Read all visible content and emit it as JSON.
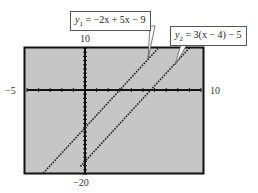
{
  "chart_data": {
    "type": "line",
    "title": "",
    "xlabel": "",
    "ylabel": "",
    "xlim": [
      -5,
      10
    ],
    "ylim": [
      -20,
      10
    ],
    "xtick_step": 1,
    "ytick_step": 1,
    "grid": false,
    "window_labels": {
      "xmin": "−5",
      "xmax": "10",
      "ymin": "−20",
      "ymax": "10"
    },
    "series": [
      {
        "name": "y1 = −2x + 5x − 9",
        "expression": "3x - 9",
        "x": [
          -3.6,
          6.8
        ],
        "y": [
          -19.8,
          11.4
        ],
        "x_intercept": 3,
        "y_intercept": -9,
        "style": "dotted"
      },
      {
        "name": "y2 = 3(x − 4) − 5",
        "expression": "3x - 17",
        "x": [
          -0.4,
          9.3
        ],
        "y": [
          -18.2,
          10.9
        ],
        "x_intercept": 5.667,
        "y_intercept": -17,
        "style": "dotted"
      }
    ],
    "annotations": [
      {
        "text": "y1 = −2x + 5x − 9",
        "points_to": "series 1"
      },
      {
        "text": "y2 = 3(x − 4) − 5",
        "points_to": "series 2"
      }
    ]
  },
  "labels": {
    "xmin": "−5",
    "xmax": "10",
    "ymin": "−20",
    "ymax": "10",
    "eq1_var": "y",
    "eq1_sub": "1",
    "eq1_rhs": " = −2x + 5x − 9",
    "eq2_var": "y",
    "eq2_sub": "2",
    "eq2_rhs": " = 3(x − 4) − 5"
  },
  "colors": {
    "screen_bg": "#c6c6c6",
    "frame": "#111111",
    "axes": "#111111",
    "lines": "#222222"
  }
}
